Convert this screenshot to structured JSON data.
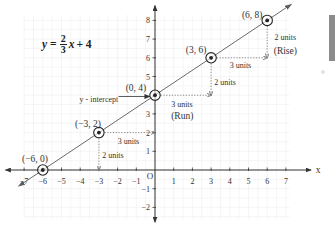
{
  "figure": {
    "equation": {
      "lhs_var": "y",
      "equals": "=",
      "numerator": "2",
      "denominator": "3",
      "rhs_var": "x",
      "rhs_rest": "+ 4"
    },
    "y_intercept": {
      "label": "y - intercept",
      "label_pos": [
        -3.0,
        3.8
      ],
      "arrow_from": [
        -1.95,
        3.93
      ],
      "arrow_to": [
        -0.27,
        3.93
      ]
    },
    "axis_labels": {
      "x": "x",
      "origin": "O"
    },
    "side_panel": {
      "color": "#8b8b8b"
    }
  },
  "colors": {
    "axis": "#333333",
    "line": "#5a5a5a",
    "dotted": "#7a7a7a",
    "grid": "#efefef",
    "text": "#333333",
    "point": "#222222"
  },
  "chart_data": {
    "type": "line",
    "xlabel": "x",
    "ylabel": "",
    "xlim": [
      -7,
      7
    ],
    "ylim": [
      -2,
      8
    ],
    "grid": true,
    "legend": "none",
    "x_ticks": [
      -7,
      -6,
      -5,
      -4,
      -3,
      -2,
      -1,
      1,
      2,
      3,
      4,
      5,
      6,
      7
    ],
    "x_tick_labels": [
      "−7",
      "−6",
      "−5",
      "−4",
      "−3",
      "−2",
      "−1",
      "1",
      "2",
      "3",
      "4",
      "5",
      "6",
      "7"
    ],
    "y_ticks": [
      -2,
      -1,
      1,
      2,
      3,
      4,
      5,
      6,
      7,
      8
    ],
    "y_tick_labels": [
      "−2",
      "−1",
      "1",
      "2",
      "3",
      "",
      "5",
      "6",
      "7",
      "8"
    ],
    "series": [
      {
        "name": "y = 2/3 x + 4",
        "slope": 0.6667,
        "intercept": 4,
        "x": [
          -6,
          -3,
          0,
          3,
          6
        ],
        "y": [
          0,
          2,
          4,
          6,
          8
        ],
        "extent": [
          -7.3,
          7.3
        ]
      }
    ],
    "points": [
      {
        "label": "(−6, 0)",
        "x": -6,
        "y": 0,
        "label_pos": [
          -6.42,
          0.62
        ]
      },
      {
        "label": "(−3, 2)",
        "x": -3,
        "y": 2,
        "label_pos": [
          -3.58,
          2.5
        ]
      },
      {
        "label": "(0, 4)",
        "x": 0,
        "y": 4,
        "label_pos": [
          -1.02,
          4.43
        ]
      },
      {
        "label": "(3, 6)",
        "x": 3,
        "y": 6,
        "label_pos": [
          2.2,
          6.46
        ]
      },
      {
        "label": "(6, 8)",
        "x": 6,
        "y": 8,
        "label_pos": [
          5.2,
          8.33
        ]
      }
    ],
    "annotations": [
      {
        "kind": "run",
        "from": [
          -3,
          2
        ],
        "to": [
          0,
          2
        ],
        "label": "3 units",
        "label_pos": [
          -1.42,
          1.55
        ],
        "sublabel": ""
      },
      {
        "kind": "rise",
        "from": [
          -3,
          2
        ],
        "to": [
          -3,
          0
        ],
        "label": "2 units",
        "label_pos": [
          -2.25,
          0.82
        ],
        "sublabel": ""
      },
      {
        "kind": "run",
        "from": [
          0,
          4
        ],
        "to": [
          3,
          4
        ],
        "label": "3 units",
        "label_pos": [
          1.44,
          3.55
        ],
        "sublabel": "(Run)",
        "sublabel_pos": [
          1.46,
          2.9
        ]
      },
      {
        "kind": "rise",
        "from": [
          3,
          6
        ],
        "to": [
          3,
          4
        ],
        "label": "2 units",
        "label_pos": [
          3.75,
          4.7
        ],
        "sublabel": ""
      },
      {
        "kind": "run",
        "from": [
          3,
          6
        ],
        "to": [
          6,
          6
        ],
        "label": "3 units",
        "label_pos": [
          4.57,
          5.6
        ],
        "sublabel": ""
      },
      {
        "kind": "rise",
        "from": [
          6,
          8
        ],
        "to": [
          6,
          6
        ],
        "label": "2 units",
        "label_pos": [
          6.97,
          7.1
        ],
        "sublabel": "(Rise)",
        "sublabel_pos": [
          6.97,
          6.35
        ]
      }
    ]
  }
}
